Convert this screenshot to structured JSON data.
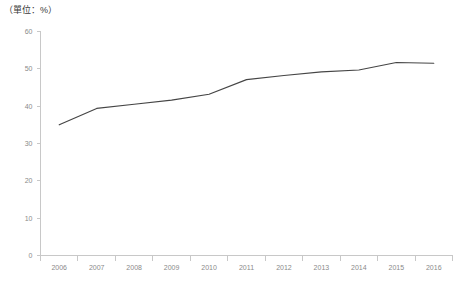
{
  "unit_label": "（單位：%）",
  "colors": {
    "line": "#454545",
    "axis": "#c8c8c8",
    "tick_label": "#8a8a8a",
    "background": "#ffffff"
  },
  "chart_data": {
    "type": "line",
    "title": "",
    "subtitle": "",
    "xlabel": "",
    "ylabel": "",
    "unit": "%",
    "categories": [
      "2006",
      "2007",
      "2008",
      "2009",
      "2010",
      "2011",
      "2012",
      "2013",
      "2014",
      "2015",
      "2016"
    ],
    "values": [
      35.0,
      39.4,
      40.5,
      41.6,
      43.2,
      47.1,
      48.2,
      49.2,
      49.7,
      51.7,
      51.5
    ],
    "series": [
      {
        "name": "",
        "values": [
          35.0,
          39.4,
          40.5,
          41.6,
          43.2,
          47.1,
          48.2,
          49.2,
          49.7,
          51.7,
          51.5
        ]
      }
    ],
    "ylim": [
      0,
      60
    ],
    "yticks": [
      0,
      10,
      20,
      30,
      40,
      50,
      60
    ],
    "ytick_labels": [
      "0",
      "10",
      "20",
      "30",
      "40",
      "50",
      "60"
    ],
    "xtick_labels": [
      "2006",
      "2007",
      "2008",
      "2009",
      "2010",
      "2011",
      "2012",
      "2013",
      "2014",
      "2015",
      "2016"
    ],
    "grid": false,
    "legend": false,
    "legend_position": "none",
    "markers": false,
    "annotations": []
  }
}
